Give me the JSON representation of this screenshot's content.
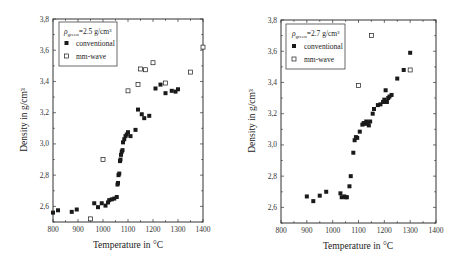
{
  "chart_data": [
    {
      "type": "scatter",
      "title": "",
      "xlabel": "Temperature  in °C",
      "ylabel": "Density  in g/cm³",
      "xlim": [
        800,
        1400
      ],
      "ylim": [
        2.5,
        3.8
      ],
      "xticks": [
        800,
        900,
        1000,
        1100,
        1200,
        1300,
        1400
      ],
      "yticks": [
        "2,6",
        "2,8",
        "3,0",
        "3,2",
        "3,4",
        "3,6",
        "3,8"
      ],
      "ytick_values": [
        2.6,
        2.8,
        3.0,
        3.2,
        3.4,
        3.6,
        3.8
      ],
      "grid": false,
      "legend": {
        "position": "upper left",
        "header": "ρgreen=2.5 g/cm³",
        "header_symbol": "ρ",
        "header_sub": "green",
        "header_rest": "=2.5 g/cm³",
        "entries": [
          "conventional",
          "mm-wave"
        ]
      },
      "series": [
        {
          "name": "conventional",
          "marker": "filled-square",
          "color": "#1a1a1a",
          "points": [
            [
              800,
              2.56
            ],
            [
              820,
              2.575
            ],
            [
              875,
              2.565
            ],
            [
              895,
              2.58
            ],
            [
              965,
              2.62
            ],
            [
              980,
              2.595
            ],
            [
              995,
              2.62
            ],
            [
              1010,
              2.605
            ],
            [
              1020,
              2.625
            ],
            [
              1025,
              2.64
            ],
            [
              1035,
              2.645
            ],
            [
              1045,
              2.65
            ],
            [
              1055,
              2.66
            ],
            [
              1058,
              2.74
            ],
            [
              1060,
              2.75
            ],
            [
              1062,
              2.8
            ],
            [
              1065,
              2.81
            ],
            [
              1068,
              2.89
            ],
            [
              1070,
              2.9
            ],
            [
              1072,
              2.93
            ],
            [
              1075,
              2.95
            ],
            [
              1078,
              2.96
            ],
            [
              1080,
              3.01
            ],
            [
              1085,
              3.03
            ],
            [
              1090,
              3.05
            ],
            [
              1095,
              3.06
            ],
            [
              1100,
              3.075
            ],
            [
              1110,
              3.05
            ],
            [
              1130,
              3.09
            ],
            [
              1140,
              3.22
            ],
            [
              1155,
              3.19
            ],
            [
              1165,
              3.165
            ],
            [
              1185,
              3.18
            ],
            [
              1210,
              3.355
            ],
            [
              1230,
              3.38
            ],
            [
              1250,
              3.325
            ],
            [
              1275,
              3.34
            ],
            [
              1290,
              3.335
            ],
            [
              1300,
              3.35
            ]
          ]
        },
        {
          "name": "mm-wave",
          "marker": "open-square",
          "color": "#1a1a1a",
          "points": [
            [
              950,
              2.52
            ],
            [
              1000,
              2.9
            ],
            [
              1100,
              3.34
            ],
            [
              1140,
              3.38
            ],
            [
              1150,
              3.48
            ],
            [
              1170,
              3.475
            ],
            [
              1200,
              3.52
            ],
            [
              1250,
              3.39
            ],
            [
              1350,
              3.46
            ],
            [
              1400,
              3.62
            ]
          ]
        }
      ]
    },
    {
      "type": "scatter",
      "title": "",
      "xlabel": "Temperature  in °C",
      "ylabel": "Density  in g/cm³",
      "xlim": [
        800,
        1400
      ],
      "ylim": [
        2.5,
        3.8
      ],
      "xticks": [
        800,
        900,
        1000,
        1100,
        1200,
        1300,
        1400
      ],
      "yticks": [
        "2,6",
        "2,8",
        "3,0",
        "3,2",
        "3,4",
        "3,6",
        "3,8"
      ],
      "ytick_values": [
        2.6,
        2.8,
        3.0,
        3.2,
        3.4,
        3.6,
        3.8
      ],
      "grid": false,
      "legend": {
        "position": "upper left",
        "header": "ρgreen=2.7 g/cm³",
        "header_symbol": "ρ",
        "header_sub": "green",
        "header_rest": "=2.7 g/cm³",
        "entries": [
          "conventional",
          "mm-wave"
        ]
      },
      "series": [
        {
          "name": "conventional",
          "marker": "filled-square",
          "color": "#1a1a1a",
          "points": [
            [
              900,
              2.67
            ],
            [
              925,
              2.64
            ],
            [
              950,
              2.675
            ],
            [
              975,
              2.7
            ],
            [
              1030,
              2.69
            ],
            [
              1035,
              2.665
            ],
            [
              1045,
              2.67
            ],
            [
              1050,
              2.665
            ],
            [
              1055,
              2.665
            ],
            [
              1065,
              2.735
            ],
            [
              1070,
              2.8
            ],
            [
              1080,
              2.95
            ],
            [
              1085,
              3.03
            ],
            [
              1090,
              3.05
            ],
            [
              1095,
              3.045
            ],
            [
              1105,
              3.085
            ],
            [
              1115,
              3.13
            ],
            [
              1120,
              3.14
            ],
            [
              1125,
              3.135
            ],
            [
              1130,
              3.15
            ],
            [
              1135,
              3.14
            ],
            [
              1140,
              3.125
            ],
            [
              1145,
              3.15
            ],
            [
              1155,
              3.2
            ],
            [
              1160,
              3.23
            ],
            [
              1175,
              3.255
            ],
            [
              1185,
              3.26
            ],
            [
              1195,
              3.275
            ],
            [
              1200,
              3.29
            ],
            [
              1205,
              3.35
            ],
            [
              1210,
              3.275
            ],
            [
              1215,
              3.3
            ],
            [
              1220,
              3.31
            ],
            [
              1228,
              3.32
            ],
            [
              1250,
              3.425
            ],
            [
              1275,
              3.48
            ],
            [
              1300,
              3.59
            ]
          ]
        },
        {
          "name": "mm-wave",
          "marker": "open-square",
          "color": "#1a1a1a",
          "points": [
            [
              1100,
              3.38
            ],
            [
              1150,
              3.7
            ],
            [
              1300,
              3.48
            ]
          ]
        }
      ]
    }
  ]
}
